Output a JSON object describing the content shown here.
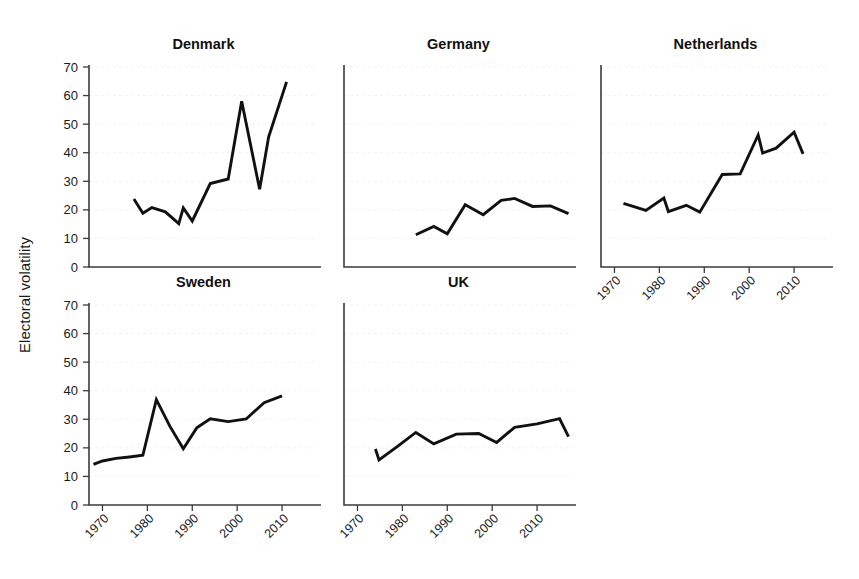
{
  "figure": {
    "ylabel": "Electoral volatility",
    "yticks": [
      0,
      10,
      20,
      30,
      40,
      50,
      60,
      70
    ],
    "xticks": [
      1970,
      1980,
      1990,
      2000,
      2010
    ],
    "xtick_labels": [
      "1970",
      "1980",
      "1990",
      "2000",
      "2010"
    ],
    "ylim": [
      0,
      70
    ],
    "xlim": [
      1967,
      2018
    ],
    "grid": true,
    "line_color": "#111111",
    "axis_color": "#3b3b3b",
    "grid_color": "#f2f2f4",
    "background": "#ffffff"
  },
  "chart_data": {
    "type": "line",
    "title": "",
    "subtitle": "",
    "xlabel": "",
    "ylabel": "Electoral volatility",
    "xlim": [
      1967,
      2018
    ],
    "ylim": [
      0,
      70
    ],
    "grid": true,
    "legend": "none",
    "layout": "small-multiples 3 columns x 2 rows, 5 panels used",
    "panels": [
      {
        "name": "Denmark",
        "row": 0,
        "col": 0,
        "x_axis_labels_shown": false,
        "y_axis_labels_shown": true,
        "x": [
          1977,
          1979,
          1981,
          1984,
          1987,
          1988,
          1990,
          1994,
          1998,
          2001,
          2005,
          2007,
          2011
        ],
        "y": [
          23.8,
          18.8,
          20.8,
          19.3,
          15.2,
          20.7,
          16.1,
          29.2,
          30.8,
          58.0,
          27.2,
          45.5,
          64.8
        ]
      },
      {
        "name": "Germany",
        "row": 0,
        "col": 1,
        "x_axis_labels_shown": false,
        "y_axis_labels_shown": false,
        "x": [
          1983,
          1987,
          1990,
          1994,
          1998,
          2002,
          2005,
          2009,
          2013,
          2017
        ],
        "y": [
          11.3,
          14.2,
          11.6,
          21.8,
          18.3,
          23.3,
          24.0,
          21.2,
          21.4,
          18.7
        ]
      },
      {
        "name": "Netherlands",
        "row": 0,
        "col": 2,
        "x_axis_labels_shown": true,
        "y_axis_labels_shown": false,
        "x": [
          1972,
          1977,
          1981,
          1982,
          1986,
          1989,
          1994,
          1998,
          2002,
          2003,
          2006,
          2010,
          2012
        ],
        "y": [
          22.3,
          19.8,
          24.1,
          19.4,
          21.6,
          19.2,
          32.4,
          32.6,
          46.2,
          39.9,
          41.6,
          47.2,
          39.6
        ]
      },
      {
        "name": "Sweden",
        "row": 1,
        "col": 0,
        "x_axis_labels_shown": true,
        "y_axis_labels_shown": true,
        "x": [
          1968,
          1970,
          1973,
          1976,
          1979,
          1982,
          1985,
          1988,
          1991,
          1994,
          1998,
          2002,
          2006,
          2010
        ],
        "y": [
          14.2,
          15.4,
          16.3,
          16.8,
          17.4,
          36.9,
          27.6,
          19.7,
          27.0,
          30.2,
          29.2,
          30.1,
          35.8,
          38.2
        ]
      },
      {
        "name": "UK",
        "row": 1,
        "col": 1,
        "x_axis_labels_shown": true,
        "y_axis_labels_shown": false,
        "x": [
          1974,
          1974.8,
          1979,
          1983,
          1987,
          1992,
          1997,
          2001,
          2005,
          2010,
          2015,
          2017
        ],
        "y": [
          19.6,
          15.8,
          20.6,
          25.4,
          21.4,
          24.8,
          25.0,
          21.9,
          27.2,
          28.4,
          30.2,
          23.9
        ]
      }
    ]
  }
}
